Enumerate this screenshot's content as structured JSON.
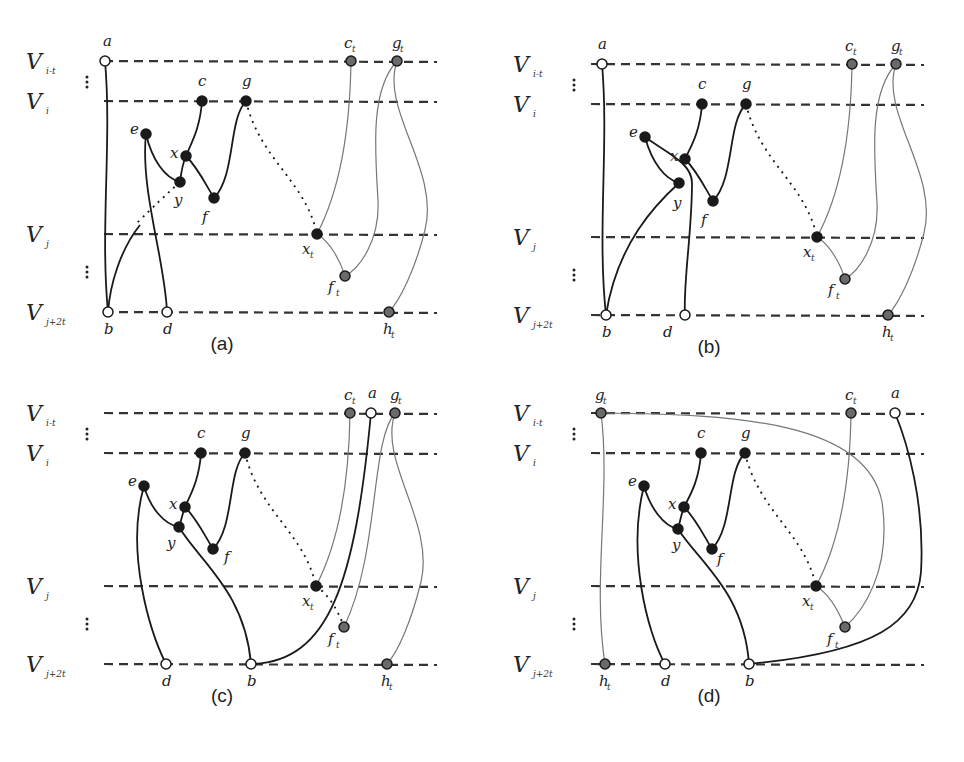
{
  "figure": {
    "layers": [
      {
        "id": "Vi-t",
        "main": "V",
        "sub": "i-t",
        "y": 61
      },
      {
        "id": "Vi",
        "main": "V",
        "sub": "i",
        "y": 101
      },
      {
        "id": "Vj",
        "main": "V",
        "sub": "j",
        "y": 234
      },
      {
        "id": "Vj+2t",
        "main": "V",
        "sub": "j+2t",
        "y": 312
      }
    ],
    "colors": {
      "black_node": "#1a1a1a",
      "gray_node": "#6a6a6a",
      "white_node": "#ffffff",
      "edge_black": "#1a1a1a",
      "edge_gray": "#777777"
    },
    "panels": [
      {
        "id": "a",
        "caption": "(a)",
        "dx": 0,
        "dy": 0,
        "nodes": [
          {
            "name": "a",
            "x": 105,
            "y": 61,
            "type": "white",
            "lx": 103,
            "ly": 46
          },
          {
            "name": "c",
            "x": 202,
            "y": 101,
            "type": "black",
            "lx": 198,
            "ly": 86
          },
          {
            "name": "g",
            "x": 246,
            "y": 101,
            "type": "black",
            "lx": 242,
            "ly": 86
          },
          {
            "name": "e",
            "x": 146,
            "y": 134,
            "type": "black",
            "lx": 130,
            "ly": 134
          },
          {
            "name": "x",
            "x": 186,
            "y": 156,
            "type": "black",
            "lx": 170,
            "ly": 158
          },
          {
            "name": "y",
            "x": 180,
            "y": 182,
            "type": "black",
            "lx": 174,
            "ly": 205
          },
          {
            "name": "f",
            "x": 214,
            "y": 198,
            "type": "black",
            "lx": 202,
            "ly": 222
          },
          {
            "name": "x",
            "sub": "t",
            "x": 317,
            "y": 234,
            "type": "black",
            "lx": 302,
            "ly": 254
          },
          {
            "name": "c",
            "sub": "t",
            "x": 351,
            "y": 61,
            "type": "gray",
            "lx": 344,
            "ly": 48
          },
          {
            "name": "g",
            "sub": "t",
            "x": 397,
            "y": 61,
            "type": "gray",
            "lx": 392,
            "ly": 48
          },
          {
            "name": "f",
            "sub": "t",
            "x": 345,
            "y": 276,
            "type": "gray",
            "lx": 328,
            "ly": 292
          },
          {
            "name": "b",
            "x": 108,
            "y": 312,
            "type": "white",
            "lx": 104,
            "ly": 334
          },
          {
            "name": "d",
            "x": 167,
            "y": 312,
            "type": "white",
            "lx": 163,
            "ly": 334
          },
          {
            "name": "h",
            "sub": "t",
            "x": 389,
            "y": 312,
            "type": "gray",
            "lx": 383,
            "ly": 334
          }
        ],
        "edges": [
          {
            "d": "M105,61 C112,140 100,230 108,312",
            "kind": "black"
          },
          {
            "d": "M202,101 C200,130 190,145 186,156",
            "kind": "black"
          },
          {
            "d": "M186,156 C182,165 181,174 180,182",
            "kind": "black"
          },
          {
            "d": "M146,134 C152,160 165,178 180,182",
            "kind": "black"
          },
          {
            "d": "M186,156 C198,168 206,185 214,198",
            "kind": "black"
          },
          {
            "d": "M214,198 C236,175 228,120 246,101",
            "kind": "black"
          },
          {
            "d": "M146,134 C140,190 165,260 167,312",
            "kind": "black"
          },
          {
            "d": "M180,182 C160,200 145,215 135,225",
            "kind": "black-dotted"
          },
          {
            "d": "M140,225 C120,250 110,285 108,312",
            "kind": "black"
          },
          {
            "d": "M246,101 C260,160 305,180 317,234",
            "kind": "dotted"
          },
          {
            "d": "M351,61 C350,130 340,190 317,234",
            "kind": "gray"
          },
          {
            "d": "M317,234 C330,242 340,260 345,276",
            "kind": "gray"
          },
          {
            "d": "M397,61 C370,90 375,150 378,200 C380,240 360,268 345,276",
            "kind": "gray"
          },
          {
            "d": "M397,61 C380,110 440,170 425,230 C415,270 400,300 389,312",
            "kind": "gray"
          }
        ]
      },
      {
        "id": "b",
        "caption": "(b)",
        "dx": 487,
        "dy": 3,
        "nodes": [
          {
            "name": "a",
            "x": 115,
            "y": 61,
            "type": "white",
            "lx": 111,
            "ly": 46
          },
          {
            "name": "c",
            "x": 215,
            "y": 101,
            "type": "black",
            "lx": 211,
            "ly": 86
          },
          {
            "name": "g",
            "x": 259,
            "y": 101,
            "type": "black",
            "lx": 255,
            "ly": 86
          },
          {
            "name": "e",
            "x": 158,
            "y": 134,
            "type": "black",
            "lx": 142,
            "ly": 134
          },
          {
            "name": "x",
            "x": 198,
            "y": 156,
            "type": "black",
            "lx": 183,
            "ly": 158
          },
          {
            "name": "y",
            "x": 192,
            "y": 180,
            "type": "black",
            "lx": 186,
            "ly": 205
          },
          {
            "name": "f",
            "x": 226,
            "y": 198,
            "type": "black",
            "lx": 214,
            "ly": 222
          },
          {
            "name": "x",
            "sub": "t",
            "x": 330,
            "y": 234,
            "type": "black",
            "lx": 316,
            "ly": 254
          },
          {
            "name": "c",
            "sub": "t",
            "x": 365,
            "y": 61,
            "type": "gray",
            "lx": 358,
            "ly": 48
          },
          {
            "name": "g",
            "sub": "t",
            "x": 409,
            "y": 61,
            "type": "gray",
            "lx": 404,
            "ly": 48
          },
          {
            "name": "f",
            "sub": "t",
            "x": 358,
            "y": 276,
            "type": "gray",
            "lx": 341,
            "ly": 292
          },
          {
            "name": "b",
            "x": 119,
            "y": 312,
            "type": "white",
            "lx": 115,
            "ly": 334
          },
          {
            "name": "d",
            "x": 198,
            "y": 312,
            "type": "white",
            "lx": 176,
            "ly": 334
          },
          {
            "name": "h",
            "sub": "t",
            "x": 401,
            "y": 312,
            "type": "gray",
            "lx": 395,
            "ly": 334
          }
        ],
        "edges": [
          {
            "d": "M115,61 C122,140 110,230 119,312",
            "kind": "black"
          },
          {
            "d": "M215,101 C213,130 203,145 198,156",
            "kind": "black"
          },
          {
            "d": "M158,134 C165,160 178,176 192,180",
            "kind": "black"
          },
          {
            "d": "M198,156 C210,168 218,185 226,198",
            "kind": "black"
          },
          {
            "d": "M226,198 C248,175 240,120 259,101",
            "kind": "black"
          },
          {
            "d": "M158,134 C180,150 205,160 205,180 C205,230 196,280 198,312",
            "kind": "black"
          },
          {
            "d": "M192,180 C170,200 130,240 119,312",
            "kind": "black"
          },
          {
            "d": "M259,101 C273,160 318,180 330,234",
            "kind": "dotted"
          },
          {
            "d": "M365,61 C364,130 354,190 330,234",
            "kind": "gray"
          },
          {
            "d": "M330,234 C343,242 353,260 358,276",
            "kind": "gray"
          },
          {
            "d": "M409,61 C382,90 387,150 390,200 C392,240 372,268 358,276",
            "kind": "gray"
          },
          {
            "d": "M409,61 C392,110 452,170 437,230 C427,270 412,300 401,312",
            "kind": "gray"
          }
        ]
      },
      {
        "id": "c",
        "caption": "(c)",
        "dx": 0,
        "dy": 352,
        "nodes": [
          {
            "name": "c",
            "sub": "t",
            "x": 350,
            "y": 61,
            "type": "gray",
            "lx": 344,
            "ly": 48
          },
          {
            "name": "a",
            "x": 371,
            "y": 61,
            "type": "white",
            "lx": 368,
            "ly": 46
          },
          {
            "name": "g",
            "sub": "t",
            "x": 395,
            "y": 61,
            "type": "gray",
            "lx": 390,
            "ly": 48
          },
          {
            "name": "c",
            "x": 201,
            "y": 101,
            "type": "black",
            "lx": 197,
            "ly": 86
          },
          {
            "name": "g",
            "x": 245,
            "y": 101,
            "type": "black",
            "lx": 241,
            "ly": 86
          },
          {
            "name": "e",
            "x": 144,
            "y": 134,
            "type": "black",
            "lx": 128,
            "ly": 134
          },
          {
            "name": "x",
            "x": 185,
            "y": 155,
            "type": "black",
            "lx": 169,
            "ly": 157
          },
          {
            "name": "y",
            "x": 179,
            "y": 175,
            "type": "black",
            "lx": 167,
            "ly": 196
          },
          {
            "name": "f",
            "x": 213,
            "y": 197,
            "type": "black",
            "lx": 224,
            "ly": 210
          },
          {
            "name": "x",
            "sub": "t",
            "x": 316,
            "y": 234,
            "type": "black",
            "lx": 302,
            "ly": 254
          },
          {
            "name": "f",
            "sub": "t",
            "x": 344,
            "y": 275,
            "type": "gray",
            "lx": 328,
            "ly": 292
          },
          {
            "name": "d",
            "x": 166,
            "y": 312,
            "type": "white",
            "lx": 162,
            "ly": 334
          },
          {
            "name": "b",
            "x": 251,
            "y": 312,
            "type": "white",
            "lx": 247,
            "ly": 334
          },
          {
            "name": "h",
            "sub": "t",
            "x": 387,
            "y": 312,
            "type": "gray",
            "lx": 381,
            "ly": 334
          }
        ],
        "edges": [
          {
            "d": "M201,101 C199,130 189,145 185,155",
            "kind": "black"
          },
          {
            "d": "M185,155 C182,163 181,170 179,175",
            "kind": "black"
          },
          {
            "d": "M144,134 C150,155 163,172 179,175",
            "kind": "black"
          },
          {
            "d": "M185,155 C197,167 205,184 213,197",
            "kind": "black"
          },
          {
            "d": "M213,197 C235,174 227,120 245,101",
            "kind": "black"
          },
          {
            "d": "M144,134 C125,200 150,280 166,312",
            "kind": "black"
          },
          {
            "d": "M179,175 C200,210 245,240 251,312",
            "kind": "black"
          },
          {
            "d": "M251,312 C330,310 355,230 371,61",
            "kind": "black"
          },
          {
            "d": "M245,101 C259,160 304,180 316,234",
            "kind": "dotted"
          },
          {
            "d": "M316,234 C328,242 338,258 344,275",
            "kind": "dotted"
          },
          {
            "d": "M350,61 C349,130 339,190 316,234",
            "kind": "gray"
          },
          {
            "d": "M395,61 C370,90 380,200 344,275",
            "kind": "gray"
          },
          {
            "d": "M395,61 C378,110 435,170 421,230 C411,270 398,300 387,312",
            "kind": "gray"
          }
        ]
      },
      {
        "id": "d",
        "caption": "(d)",
        "dx": 487,
        "dy": 352,
        "nodes": [
          {
            "name": "g",
            "sub": "t",
            "x": 114,
            "y": 61,
            "type": "gray",
            "lx": 108,
            "ly": 48
          },
          {
            "name": "c",
            "sub": "t",
            "x": 364,
            "y": 61,
            "type": "gray",
            "lx": 358,
            "ly": 48
          },
          {
            "name": "a",
            "x": 408,
            "y": 61,
            "type": "white",
            "lx": 404,
            "ly": 46
          },
          {
            "name": "c",
            "x": 214,
            "y": 101,
            "type": "black",
            "lx": 210,
            "ly": 86
          },
          {
            "name": "g",
            "x": 258,
            "y": 101,
            "type": "black",
            "lx": 254,
            "ly": 86
          },
          {
            "name": "e",
            "x": 157,
            "y": 134,
            "type": "black",
            "lx": 141,
            "ly": 134
          },
          {
            "name": "x",
            "x": 197,
            "y": 155,
            "type": "black",
            "lx": 181,
            "ly": 157
          },
          {
            "name": "y",
            "x": 191,
            "y": 177,
            "type": "black",
            "lx": 185,
            "ly": 198
          },
          {
            "name": "f",
            "x": 225,
            "y": 197,
            "type": "black",
            "lx": 230,
            "ly": 212
          },
          {
            "name": "x",
            "sub": "t",
            "x": 329,
            "y": 234,
            "type": "black",
            "lx": 315,
            "ly": 254
          },
          {
            "name": "f",
            "sub": "t",
            "x": 358,
            "y": 275,
            "type": "gray",
            "lx": 340,
            "ly": 292
          },
          {
            "name": "h",
            "sub": "t",
            "x": 118,
            "y": 312,
            "type": "gray",
            "lx": 112,
            "ly": 334
          },
          {
            "name": "d",
            "x": 178,
            "y": 312,
            "type": "white",
            "lx": 174,
            "ly": 334
          },
          {
            "name": "b",
            "x": 262,
            "y": 312,
            "type": "white",
            "lx": 258,
            "ly": 334
          }
        ],
        "edges": [
          {
            "d": "M114,61 C124,140 105,230 118,312",
            "kind": "gray"
          },
          {
            "d": "M114,61 C250,62 380,70 395,150 C405,220 375,260 358,275",
            "kind": "gray"
          },
          {
            "d": "M214,101 C212,130 202,145 197,155",
            "kind": "black"
          },
          {
            "d": "M197,155 C194,163 193,170 191,177",
            "kind": "black"
          },
          {
            "d": "M157,134 C163,155 176,174 191,177",
            "kind": "black"
          },
          {
            "d": "M197,155 C209,167 217,184 225,197",
            "kind": "black"
          },
          {
            "d": "M225,197 C247,174 239,120 258,101",
            "kind": "black"
          },
          {
            "d": "M157,134 C140,200 160,280 178,312",
            "kind": "black"
          },
          {
            "d": "M191,177 C212,210 257,240 262,312",
            "kind": "black"
          },
          {
            "d": "M262,312 C390,300 430,270 434,220 C438,150 420,90 408,61",
            "kind": "black"
          },
          {
            "d": "M258,101 C272,160 317,180 329,234",
            "kind": "dotted"
          },
          {
            "d": "M364,61 C363,130 353,190 329,234",
            "kind": "gray"
          },
          {
            "d": "M329,234 C342,242 352,260 358,275",
            "kind": "gray"
          }
        ]
      }
    ],
    "line_span": {
      "x1": 82,
      "x2": 437
    },
    "vdots": [
      {
        "y": 82
      },
      {
        "y": 272
      }
    ]
  }
}
